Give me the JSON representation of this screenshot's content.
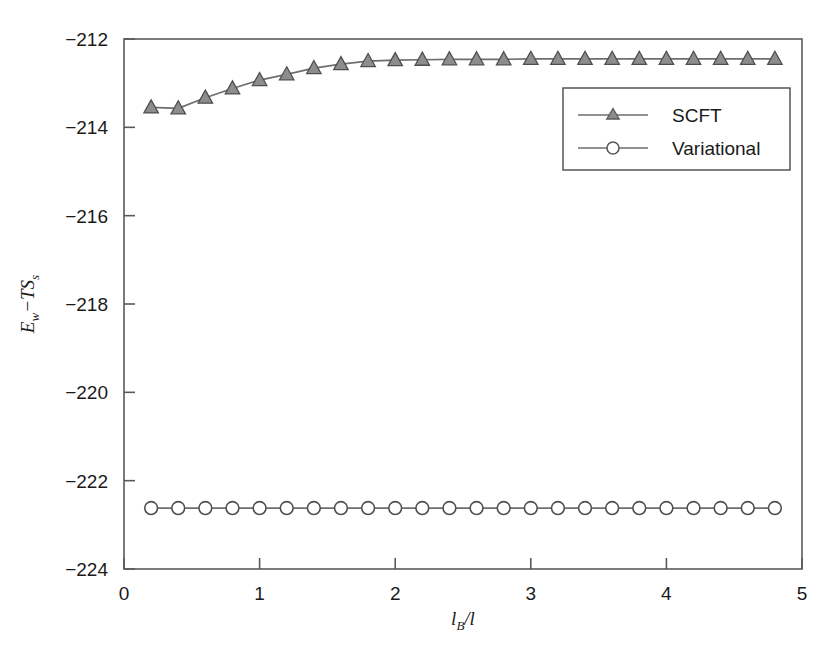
{
  "figure": {
    "background_color": "#ffffff",
    "axis_color": "#5a5a5a",
    "series_color": "#6e6e6e",
    "text_color": "#1a1a1a"
  },
  "chart_data": {
    "type": "line",
    "title": "",
    "subtitle": "",
    "xlabel": "l_B/l",
    "xlabel_parts": {
      "main": "l",
      "sub": "B",
      "tail": "/l"
    },
    "ylabel": "E_w-TS_s",
    "ylabel_parts": {
      "e": "E",
      "e_sub": "w",
      "dash": "−",
      "ts": "TS",
      "ts_sub": "s"
    },
    "xlim": [
      0,
      5
    ],
    "ylim": [
      -224,
      -212
    ],
    "xticks": [
      0,
      1,
      2,
      3,
      4,
      5
    ],
    "xtick_labels": [
      "0",
      "1",
      "2",
      "3",
      "4",
      "5"
    ],
    "yticks": [
      -224,
      -222,
      -220,
      -218,
      -216,
      -214,
      -212
    ],
    "ytick_labels": [
      "−224",
      "−222",
      "−220",
      "−218",
      "−216",
      "−214",
      "−212"
    ],
    "grid": false,
    "legend_position": "upper right",
    "x": [
      0.2,
      0.4,
      0.6,
      0.8,
      1.0,
      1.2,
      1.4,
      1.6,
      1.8,
      2.0,
      2.2,
      2.4,
      2.6,
      2.8,
      3.0,
      3.2,
      3.4,
      3.6,
      3.8,
      4.0,
      4.2,
      4.4,
      4.6,
      4.8
    ],
    "series": [
      {
        "name": "SCFT",
        "marker": "triangle",
        "color": "#6e6e6e",
        "values": [
          -213.55,
          -213.57,
          -213.33,
          -213.12,
          -212.93,
          -212.8,
          -212.66,
          -212.57,
          -212.5,
          -212.48,
          -212.47,
          -212.46,
          -212.46,
          -212.46,
          -212.45,
          -212.45,
          -212.45,
          -212.45,
          -212.45,
          -212.45,
          -212.45,
          -212.45,
          -212.45,
          -212.45
        ]
      },
      {
        "name": "Variational",
        "marker": "circle",
        "color": "#6e6e6e",
        "values": [
          -222.62,
          -222.62,
          -222.62,
          -222.62,
          -222.62,
          -222.62,
          -222.62,
          -222.62,
          -222.62,
          -222.62,
          -222.62,
          -222.62,
          -222.62,
          -222.62,
          -222.62,
          -222.62,
          -222.62,
          -222.62,
          -222.62,
          -222.62,
          -222.62,
          -222.62,
          -222.62,
          -222.62
        ]
      }
    ]
  },
  "legend": {
    "entries": [
      {
        "label": "SCFT",
        "marker": "triangle"
      },
      {
        "label": "Variational",
        "marker": "circle"
      }
    ]
  }
}
